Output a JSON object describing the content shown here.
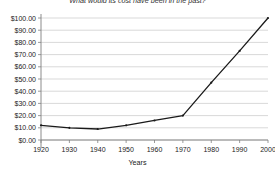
{
  "chart_data": {
    "type": "line",
    "title": "What would its cost have been in the past?",
    "xlabel": "Years",
    "ylabel": "",
    "x": [
      1920,
      1930,
      1940,
      1950,
      1960,
      1970,
      1980,
      1990,
      2000
    ],
    "values": [
      12.0,
      10.0,
      9.0,
      12.0,
      16.0,
      20.0,
      47.0,
      73.0,
      100.0
    ],
    "series": [
      {
        "name": "Cost",
        "values": [
          12.0,
          10.0,
          9.0,
          12.0,
          16.0,
          20.0,
          47.0,
          73.0,
          100.0
        ]
      }
    ],
    "xlim": [
      1920,
      2000
    ],
    "ylim": [
      0,
      100
    ],
    "ytick_labels": [
      "$100.00",
      "$90.00",
      "$80.00",
      "$70.00",
      "$60.00",
      "$50.00",
      "$40.00",
      "$30.00",
      "$20.00",
      "$10.00",
      "$0.00"
    ],
    "ytick_values": [
      100,
      90,
      80,
      70,
      60,
      50,
      40,
      30,
      20,
      10,
      0
    ],
    "xtick_labels": [
      "1920",
      "1930",
      "1940",
      "1950",
      "1960",
      "1970",
      "1980",
      "1990",
      "2000"
    ],
    "grid": true,
    "grid_axis": "y",
    "legend": false,
    "line_color": "#1a1a1a",
    "grid_color": "#c8c8c8",
    "axis_color": "#808080",
    "background": "#ffffff"
  }
}
